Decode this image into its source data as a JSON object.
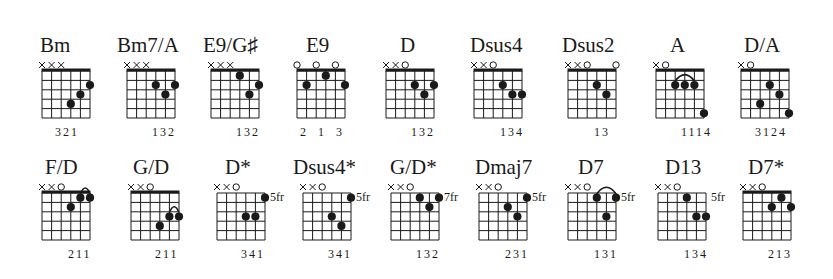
{
  "chords": [
    {
      "name": "Bm",
      "x": 42,
      "y": 71,
      "nameX": 40,
      "nameY": 33,
      "nut": true,
      "markers": [
        "x",
        "x",
        "x",
        "",
        "",
        ""
      ],
      "dots": [
        [
          4,
          4
        ],
        [
          5,
          3
        ],
        [
          6,
          2
        ]
      ],
      "barres": [],
      "fret_label": "",
      "fingers": "321",
      "fingersX": 55
    },
    {
      "name": "Bm7/A",
      "x": 127,
      "y": 71,
      "nameX": 117,
      "nameY": 33,
      "nut": true,
      "markers": [
        "x",
        "x",
        "x",
        "",
        "",
        ""
      ],
      "dots": [
        [
          4,
          2
        ],
        [
          5,
          3
        ],
        [
          6,
          2
        ]
      ],
      "barres": [],
      "fret_label": "",
      "fingers": "132",
      "fingersX": 152
    },
    {
      "name": "E9/G♯",
      "x": 211,
      "y": 71,
      "nameX": 203,
      "nameY": 33,
      "nut": true,
      "markers": [
        "x",
        "x",
        "x",
        "",
        "",
        ""
      ],
      "dots": [
        [
          4,
          1
        ],
        [
          5,
          3
        ],
        [
          6,
          2
        ]
      ],
      "barres": [],
      "fret_label": "",
      "fingers": "132",
      "fingersX": 236
    },
    {
      "name": "E9",
      "x": 297,
      "y": 71,
      "nameX": 306,
      "nameY": 33,
      "nut": true,
      "markers": [
        "o",
        "",
        "o",
        "",
        "o",
        ""
      ],
      "dots": [
        [
          2,
          2
        ],
        [
          4,
          1
        ],
        [
          6,
          2
        ]
      ],
      "barres": [],
      "fret_label": "",
      "fingers": "2  1  3",
      "fingersX": 300
    },
    {
      "name": "D",
      "x": 386,
      "y": 71,
      "nameX": 400,
      "nameY": 33,
      "nut": true,
      "markers": [
        "x",
        "x",
        "o",
        "",
        "",
        ""
      ],
      "dots": [
        [
          4,
          2
        ],
        [
          5,
          3
        ],
        [
          6,
          2
        ]
      ],
      "barres": [],
      "fret_label": "",
      "fingers": "132",
      "fingersX": 411
    },
    {
      "name": "Dsus4",
      "x": 474,
      "y": 71,
      "nameX": 470,
      "nameY": 33,
      "nut": true,
      "markers": [
        "x",
        "x",
        "o",
        "",
        "",
        ""
      ],
      "dots": [
        [
          4,
          2
        ],
        [
          5,
          3
        ],
        [
          6,
          3
        ]
      ],
      "barres": [],
      "fret_label": "",
      "fingers": "134",
      "fingersX": 500
    },
    {
      "name": "Dsus2",
      "x": 568,
      "y": 71,
      "nameX": 562,
      "nameY": 33,
      "nut": true,
      "markers": [
        "x",
        "x",
        "o",
        "",
        "",
        "o"
      ],
      "dots": [
        [
          4,
          2
        ],
        [
          5,
          3
        ]
      ],
      "barres": [],
      "fret_label": "",
      "fingers": "13",
      "fingersX": 594
    },
    {
      "name": "A",
      "x": 656,
      "y": 71,
      "nameX": 670,
      "nameY": 33,
      "nut": true,
      "markers": [
        "x",
        "o",
        "",
        "",
        "",
        ""
      ],
      "dots": [
        [
          3,
          2
        ],
        [
          4,
          2
        ],
        [
          5,
          2
        ],
        [
          6,
          5
        ]
      ],
      "barres": [
        [
          3,
          5,
          2
        ]
      ],
      "fret_label": "",
      "fingers": "1114",
      "fingersX": 681
    },
    {
      "name": "D/A",
      "x": 741,
      "y": 71,
      "nameX": 744,
      "nameY": 33,
      "nut": true,
      "markers": [
        "x",
        "o",
        "",
        "",
        "",
        ""
      ],
      "dots": [
        [
          3,
          4
        ],
        [
          4,
          2
        ],
        [
          5,
          3
        ],
        [
          6,
          5
        ]
      ],
      "barres": [],
      "fret_label": "",
      "fingers": "3124",
      "fingersX": 755
    },
    {
      "name": "F/D",
      "x": 42,
      "y": 193,
      "nameX": 45,
      "nameY": 155,
      "nut": true,
      "markers": [
        "x",
        "x",
        "o",
        "",
        "",
        ""
      ],
      "dots": [
        [
          4,
          2
        ],
        [
          5,
          1
        ],
        [
          6,
          1
        ]
      ],
      "barres": [
        [
          5,
          6,
          1
        ]
      ],
      "fret_label": "",
      "fingers": "211",
      "fingersX": 68
    },
    {
      "name": "G/D",
      "x": 131,
      "y": 193,
      "nameX": 133,
      "nameY": 155,
      "nut": true,
      "markers": [
        "x",
        "x",
        "o",
        "",
        "",
        ""
      ],
      "dots": [
        [
          4,
          4
        ],
        [
          5,
          3
        ],
        [
          6,
          3
        ]
      ],
      "barres": [
        [
          5,
          6,
          3
        ]
      ],
      "fret_label": "",
      "fingers": "211",
      "fingersX": 155
    },
    {
      "name": "D*",
      "x": 217,
      "y": 193,
      "nameX": 225,
      "nameY": 155,
      "nut": false,
      "markers": [
        "x",
        "x",
        "o",
        "",
        "",
        ""
      ],
      "dots": [
        [
          4,
          3
        ],
        [
          5,
          3
        ],
        [
          6,
          1
        ]
      ],
      "barres": [],
      "fret_label": "5fr",
      "fingers": "341",
      "fingersX": 241
    },
    {
      "name": "Dsus4*",
      "x": 303,
      "y": 193,
      "nameX": 293,
      "nameY": 155,
      "nut": false,
      "markers": [
        "x",
        "x",
        "o",
        "",
        "",
        ""
      ],
      "dots": [
        [
          4,
          3
        ],
        [
          5,
          4
        ],
        [
          6,
          1
        ]
      ],
      "barres": [],
      "fret_label": "5fr",
      "fingers": "341",
      "fingersX": 328
    },
    {
      "name": "G/D*",
      "x": 391,
      "y": 193,
      "nameX": 390,
      "nameY": 155,
      "nut": false,
      "markers": [
        "x",
        "x",
        "o",
        "",
        "",
        ""
      ],
      "dots": [
        [
          4,
          1
        ],
        [
          5,
          2
        ],
        [
          6,
          1
        ]
      ],
      "barres": [],
      "fret_label": "7fr",
      "fingers": "132",
      "fingersX": 416
    },
    {
      "name": "Dmaj7",
      "x": 479,
      "y": 193,
      "nameX": 475,
      "nameY": 155,
      "nut": false,
      "markers": [
        "x",
        "x",
        "o",
        "",
        "",
        ""
      ],
      "dots": [
        [
          4,
          2
        ],
        [
          5,
          3
        ],
        [
          6,
          1
        ]
      ],
      "barres": [],
      "fret_label": "5fr",
      "fingers": "231",
      "fingersX": 505
    },
    {
      "name": "D7",
      "x": 568,
      "y": 193,
      "nameX": 578,
      "nameY": 155,
      "nut": false,
      "markers": [
        "x",
        "x",
        "o",
        "",
        "",
        ""
      ],
      "dots": [
        [
          4,
          1
        ],
        [
          5,
          3
        ],
        [
          6,
          1
        ]
      ],
      "barres": [
        [
          4,
          6,
          1
        ]
      ],
      "fret_label": "5fr",
      "fingers": "131",
      "fingersX": 594
    },
    {
      "name": "D13",
      "x": 658,
      "y": 193,
      "nameX": 665,
      "nameY": 155,
      "nut": false,
      "markers": [
        "x",
        "x",
        "o",
        "",
        "",
        ""
      ],
      "dots": [
        [
          4,
          1
        ],
        [
          5,
          3
        ],
        [
          6,
          3
        ]
      ],
      "barres": [],
      "fret_label": "5fr",
      "fingers": "134",
      "fingersX": 684
    },
    {
      "name": "D7*",
      "x": 743,
      "y": 193,
      "nameX": 748,
      "nameY": 155,
      "nut": true,
      "markers": [
        "x",
        "x",
        "o",
        "",
        "",
        ""
      ],
      "dots": [
        [
          4,
          2
        ],
        [
          5,
          1
        ],
        [
          6,
          2
        ]
      ],
      "barres": [],
      "fret_label": "",
      "fingers": "213",
      "fingersX": 768
    }
  ],
  "grid": {
    "strings": 6,
    "frets": 5,
    "stringGap": 9.6,
    "fretGap": 9.4
  },
  "colors": {
    "ink": "#1a1a1a",
    "background": "#ffffff"
  }
}
